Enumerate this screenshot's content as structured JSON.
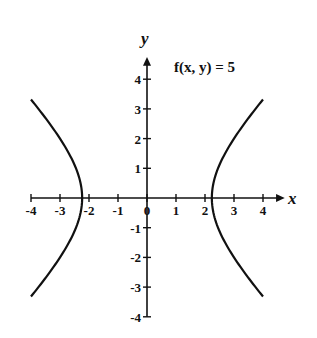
{
  "chart_data": {
    "type": "line",
    "title": "f(x, y) = 5",
    "xlabel": "x",
    "ylabel": "y",
    "xlim": [
      -4,
      4
    ],
    "ylim": [
      -4,
      4.6
    ],
    "grid": false,
    "x_ticks": [
      "-4",
      "-3",
      "-2",
      "-1",
      "0",
      "1",
      "2",
      "3",
      "4"
    ],
    "y_ticks": [
      "4",
      "3",
      "2",
      "1",
      "-1",
      "-2",
      "-3",
      "-4"
    ],
    "series": [
      {
        "name": "right branch (x^2 - y^2 = 5)",
        "x": [
          4.0,
          3.5,
          3.0,
          2.6,
          2.236,
          2.6,
          3.0,
          3.5,
          4.0
        ],
        "y": [
          3.32,
          2.74,
          2.0,
          1.33,
          0,
          -1.33,
          -2.0,
          -2.74,
          -3.32
        ]
      },
      {
        "name": "left branch (x^2 - y^2 = 5)",
        "x": [
          -4.0,
          -3.5,
          -3.0,
          -2.6,
          -2.236,
          -2.6,
          -3.0,
          -3.5,
          -4.0
        ],
        "y": [
          3.32,
          2.74,
          2.0,
          1.33,
          0,
          -1.33,
          -2.0,
          -2.74,
          -3.32
        ]
      }
    ]
  },
  "labels": {
    "title": "f(x, y) = 5",
    "x_axis": "x",
    "y_axis": "y"
  }
}
